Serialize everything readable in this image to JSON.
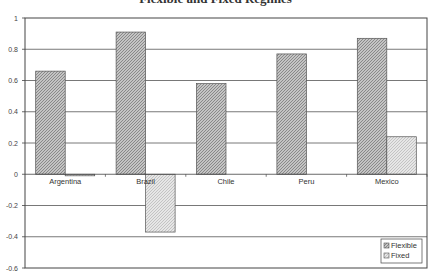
{
  "chart_data": {
    "type": "bar",
    "title": "Flexible and Fixed Regimes",
    "xlabel": "",
    "ylabel": "",
    "categories": [
      "Argentina",
      "Brazil",
      "Chile",
      "Peru",
      "Mexico"
    ],
    "series": [
      {
        "name": "Flexible",
        "values": [
          0.66,
          0.91,
          0.58,
          0.77,
          0.87
        ],
        "color": "#b0b0b0"
      },
      {
        "name": "Fixed",
        "values": [
          -0.01,
          -0.37,
          0.0,
          0.0,
          0.24
        ],
        "color": "#dcdcdc"
      }
    ],
    "ylim": [
      -0.6,
      1.0
    ],
    "yticks": [
      "1",
      "0.8",
      "0.6",
      "0.4",
      "0.2",
      "0",
      "-0.2",
      "-0.4",
      "-0.6"
    ],
    "grid": true,
    "legend_position": "bottom-right"
  }
}
